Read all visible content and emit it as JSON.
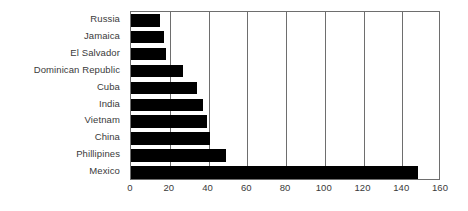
{
  "chart_data": {
    "type": "bar",
    "orientation": "horizontal",
    "title": "",
    "xlabel": "",
    "ylabel": "",
    "categories": [
      "Russia",
      "Jamaica",
      "El Salvador",
      "Dominican Republic",
      "Cuba",
      "India",
      "Vietnam",
      "China",
      "Phillipines",
      "Mexico"
    ],
    "values": [
      15,
      17,
      18,
      27,
      34,
      37,
      39,
      41,
      49,
      148
    ],
    "xlim": [
      0,
      160
    ],
    "xticks": [
      0,
      20,
      40,
      60,
      80,
      100,
      120,
      140,
      160
    ],
    "xtick_labels": [
      "0",
      "20",
      "40",
      "60",
      "80",
      "100",
      "120",
      "140",
      "160"
    ],
    "grid": "vertical",
    "legend": "none",
    "bar_color": "#000000",
    "axis_color": "#6e6e6e",
    "label_color": "#3a3a3a",
    "background_color": "#ffffff"
  }
}
